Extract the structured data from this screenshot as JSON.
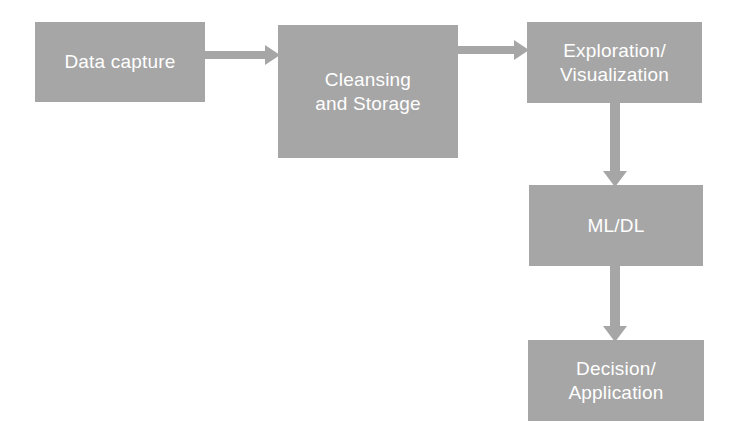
{
  "diagram": {
    "background_color": "#ffffff",
    "node_fill_color": "#a6a6a6",
    "node_text_color": "#ffffff",
    "connector_color": "#a6a6a6",
    "nodes": [
      {
        "id": "data-capture",
        "label": "Data capture"
      },
      {
        "id": "cleansing",
        "label": "Cleansing\nand Storage"
      },
      {
        "id": "exploration",
        "label": "Exploration/\nVisualization"
      },
      {
        "id": "mldl",
        "label": "ML/DL"
      },
      {
        "id": "decision",
        "label": "Decision/\nApplication"
      }
    ],
    "connectors": [
      {
        "id": "capture-to-cleansing",
        "from": "data-capture",
        "to": "cleansing",
        "direction": "right"
      },
      {
        "id": "cleansing-to-exploration",
        "from": "cleansing",
        "to": "exploration",
        "direction": "right"
      },
      {
        "id": "exploration-to-mldl",
        "from": "exploration",
        "to": "mldl",
        "direction": "down"
      },
      {
        "id": "mldl-to-decision",
        "from": "mldl",
        "to": "decision",
        "direction": "down"
      }
    ]
  }
}
